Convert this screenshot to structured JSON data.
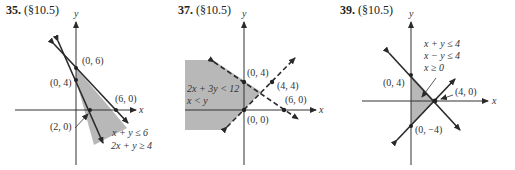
{
  "problems": [
    {
      "number": "35.",
      "section": "(§10.5)",
      "axis_x": "x",
      "axis_y": "y",
      "points": [
        "(0, 6)",
        "(0, 4)",
        "(6, 0)",
        "(2, 0)"
      ],
      "inequalities": [
        "x + y ≤ 6",
        "2x + y ≥ 4"
      ],
      "line_style": "solid"
    },
    {
      "number": "37.",
      "section": "(§10.5)",
      "axis_x": "x",
      "axis_y": "y",
      "points": [
        "(0, 4)",
        "(4, 4)",
        "(6, 0)",
        "(0, 0)"
      ],
      "inequalities": [
        "2x + 3y < 12",
        "x < y"
      ],
      "line_style": "dashed"
    },
    {
      "number": "39.",
      "section": "(§10.5)",
      "axis_x": "x",
      "axis_y": "y",
      "points": [
        "(0, 4)",
        "(4, 0)",
        "(0, −4)"
      ],
      "inequalities": [
        "x + y ≤ 4",
        "x − y ≤ 4",
        "x ≥ 0"
      ],
      "line_style": "solid"
    }
  ],
  "colors": {
    "shade": "#b8b8b8",
    "line": "#2a2a2a"
  }
}
